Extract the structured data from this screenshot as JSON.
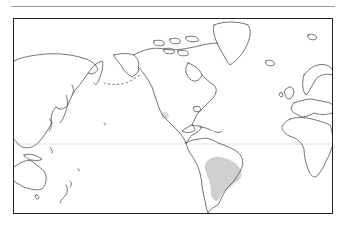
{
  "map": {
    "type": "world-outline-map",
    "projection": "equirectangular, Pacific-left centered on Americas",
    "colors": {
      "coastline": "#3a3a3a",
      "range_fill": "#d0d0d0",
      "background": "#ffffff",
      "frame": "#222222",
      "equator": "#d6d6d6"
    },
    "regions_shaded": [
      {
        "name": "south-america-range",
        "description": "central/south-eastern South America (Paraguay, southern Brazil, northern Argentina)"
      },
      {
        "name": "california-spot",
        "description": "small patch on California coast"
      }
    ],
    "features": [
      "coastlines",
      "equator-line",
      "frame"
    ]
  }
}
